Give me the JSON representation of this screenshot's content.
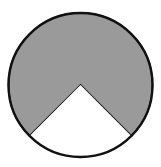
{
  "diagram": {
    "type": "circle-sector",
    "circle": {
      "cx": 80.5,
      "cy": 85,
      "r": 72
    },
    "shaded_sector": {
      "fraction": 0.75,
      "degrees": 270,
      "color": "#9a9a9a"
    },
    "unshaded_sector": {
      "fraction": 0.25,
      "degrees": 90,
      "color": "#ffffff",
      "start_angle_deg": 45,
      "end_angle_deg": 135
    },
    "stroke_color": "#111111"
  }
}
